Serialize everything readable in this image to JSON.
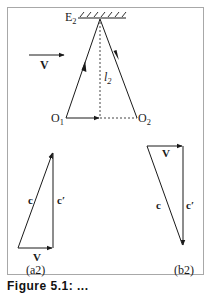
{
  "diagram": {
    "top": {
      "anchor_label": "E",
      "anchor_sub": "2",
      "velocity_label": "V",
      "length_label": "l",
      "length_sub": "2",
      "left_point_label": "O",
      "left_point_sub": "1",
      "right_point_label": "O",
      "right_point_sub": "2"
    },
    "panel_a2": {
      "label": "(a2)",
      "vector_c": "c",
      "vector_c_prime": "c′",
      "vector_v": "V"
    },
    "panel_b2": {
      "label": "(b2)",
      "vector_c": "c",
      "vector_c_prime": "c′",
      "vector_v": "V"
    },
    "caption": "Figure 5.1: ..."
  },
  "colors": {
    "line": "#1a1a1a",
    "frame": "#a8a8a8",
    "dashed": "#444444"
  }
}
